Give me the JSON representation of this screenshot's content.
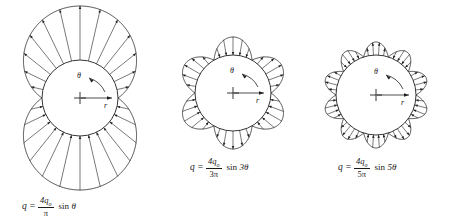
{
  "figure": {
    "background_color": "#ffffff",
    "stroke_color": "#231f20",
    "width": 454,
    "height": 223
  },
  "chart_data": {
    "type": "line",
    "title": "",
    "subtitle": "",
    "xlabel": "",
    "ylabel": "",
    "series": [
      {
        "name": "q = (4q_o/pi) sin(theta)",
        "harmonic": 1,
        "amplitude_numerator": "4q_o",
        "amplitude_denominator": "pi",
        "lobes": 2,
        "lobe_directions": [
          "outward",
          "inward"
        ],
        "arrows_per_lobe": 13
      },
      {
        "name": "q = (4q_o/3pi) sin(3theta)",
        "harmonic": 3,
        "amplitude_numerator": "4q_o",
        "amplitude_denominator": "3pi",
        "lobes": 6,
        "lobe_directions": [
          "inward",
          "outward",
          "inward",
          "outward",
          "inward",
          "outward"
        ],
        "arrows_per_lobe": 5
      },
      {
        "name": "q = (4q_o/5pi) sin(5theta)",
        "harmonic": 5,
        "amplitude_numerator": "4q_o",
        "amplitude_denominator": "5pi",
        "lobes": 10,
        "lobe_directions": [
          "inward",
          "outward",
          "inward",
          "outward",
          "inward",
          "outward",
          "inward",
          "outward",
          "inward",
          "outward"
        ],
        "arrows_per_lobe": 4
      }
    ]
  },
  "panels": [
    {
      "id": "panel-sin-theta",
      "center_marker": "+",
      "angle_label": "θ",
      "radius_label": "r",
      "formula": {
        "lhs": "q",
        "equals": "=",
        "numerator": "4q",
        "numerator_subscript": "o",
        "denominator": "π",
        "trig": "sin",
        "argument": "θ"
      }
    },
    {
      "id": "panel-sin-3theta",
      "center_marker": "+",
      "angle_label": "θ",
      "radius_label": "r",
      "formula": {
        "lhs": "q",
        "equals": "=",
        "numerator": "4q",
        "numerator_subscript": "o",
        "denominator": "3π",
        "trig": "sin",
        "argument": "3θ"
      }
    },
    {
      "id": "panel-sin-5theta",
      "center_marker": "+",
      "angle_label": "θ",
      "radius_label": "r",
      "formula": {
        "lhs": "q",
        "equals": "=",
        "numerator": "4q",
        "numerator_subscript": "o",
        "denominator": "5π",
        "trig": "sin",
        "argument": "5θ"
      }
    }
  ]
}
